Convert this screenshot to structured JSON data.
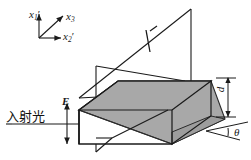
{
  "figure": {
    "title_visible": false,
    "background_color": "#ffffff",
    "stroke_color": "#1a1a1a",
    "plane_fill_color": "#a8a8a8",
    "plane_edge_color": "#2b2b2b",
    "width": 251,
    "height": 160
  },
  "axes": {
    "name": "coordinate-triad",
    "origin_label": "",
    "labels": {
      "x1": {
        "base": "x",
        "sub": "1",
        "prime": "′"
      },
      "x3": {
        "base": "x",
        "sub": "3",
        "prime": ""
      },
      "x2": {
        "base": "x",
        "sub": "2",
        "prime": "′"
      }
    }
  },
  "annotations": {
    "field_label": "E",
    "incident_light_label": "入射光",
    "thickness_label": "d",
    "angle_label": "θ"
  }
}
